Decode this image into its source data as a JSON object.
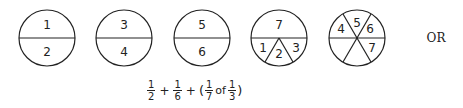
{
  "circles": [
    {
      "id": "circle-1",
      "type": "halves",
      "labels": [
        "1",
        "2"
      ]
    },
    {
      "id": "circle-2",
      "type": "halves",
      "labels": [
        "3",
        "4"
      ]
    },
    {
      "id": "circle-3",
      "type": "halves",
      "labels": [
        "5",
        "6"
      ]
    },
    {
      "id": "circle-4",
      "type": "half-plus-thirds",
      "labels": [
        "7",
        "1",
        "2",
        "3"
      ]
    },
    {
      "id": "circle-5",
      "type": "sixths",
      "labels": [
        "4",
        "5",
        "6",
        "7"
      ]
    }
  ],
  "or_label": "OR",
  "formula": {
    "terms": [
      {
        "num": "1",
        "den": "2"
      },
      {
        "op": "+"
      },
      {
        "num": "1",
        "den": "6"
      },
      {
        "op": "+"
      },
      {
        "open": "("
      },
      {
        "num": "1",
        "den": "7"
      },
      {
        "word": "of"
      },
      {
        "num": "1",
        "den": "3"
      },
      {
        "close": ")"
      }
    ],
    "f1_num": "1",
    "f1_den": "2",
    "plus1": "+",
    "f2_num": "1",
    "f2_den": "6",
    "plus2": "+",
    "open_paren": "(",
    "f3_num": "1",
    "f3_den": "7",
    "of": "of",
    "f4_num": "1",
    "f4_den": "3",
    "close_paren": ")"
  },
  "colors": {
    "stroke": "#222222",
    "background": "#ffffff"
  }
}
